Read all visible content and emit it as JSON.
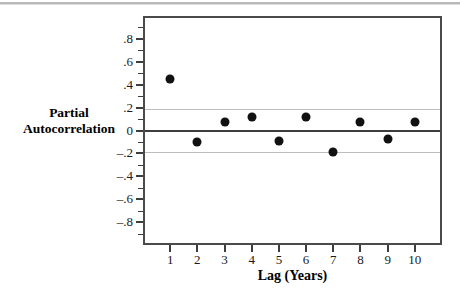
{
  "chart_data": {
    "type": "scatter",
    "title": "",
    "xlabel": "Lag (Years)",
    "ylabel_lines": [
      "Partial",
      "Autocorrelation"
    ],
    "x": [
      1,
      2,
      3,
      4,
      5,
      6,
      7,
      8,
      9,
      10
    ],
    "values": [
      0.45,
      -0.1,
      0.07,
      0.12,
      -0.09,
      0.12,
      -0.19,
      0.07,
      -0.07,
      0.07
    ],
    "series": [
      {
        "name": "Partial Autocorrelation",
        "values": [
          0.45,
          -0.1,
          0.07,
          0.12,
          -0.09,
          0.12,
          -0.19,
          0.07,
          -0.07,
          0.07
        ]
      }
    ],
    "xlim": [
      0,
      11
    ],
    "ylim": [
      -1.0,
      1.0
    ],
    "xtick_labels": [
      "1",
      "2",
      "3",
      "4",
      "5",
      "6",
      "7",
      "8",
      "9",
      "10"
    ],
    "ytick_values": [
      0.8,
      0.6,
      0.4,
      0.2,
      0,
      -0.2,
      -0.4,
      -0.6,
      -0.8
    ],
    "ytick_labels": [
      ".8",
      ".6",
      ".4",
      ".2",
      "0",
      "–.2",
      "–.4",
      "–.6",
      "–.8"
    ],
    "y_minor_tick_values": [
      0.9,
      0.7,
      0.5,
      0.3,
      0.1,
      -0.1,
      -0.3,
      -0.5,
      -0.7,
      -0.9
    ],
    "reference_lines": [
      {
        "name": "upper-confidence-limit",
        "value": 0.19,
        "color": "#bdbdbd"
      },
      {
        "name": "zero-line",
        "value": 0.0,
        "color": "#3d3d3d"
      },
      {
        "name": "lower-confidence-limit",
        "value": -0.19,
        "color": "#bdbdbd"
      }
    ],
    "grid": false,
    "legend": "none",
    "marker_color": "#111111",
    "frame_color": "#4a4a4a"
  }
}
